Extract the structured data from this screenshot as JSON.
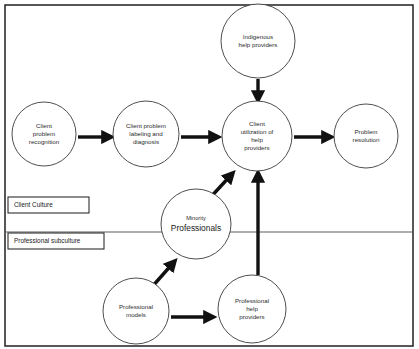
{
  "diagram": {
    "frame": {
      "x": 5,
      "y": 5,
      "width": 408,
      "height": 341
    },
    "divider": {
      "y": 232,
      "x1": 5,
      "x2": 413,
      "label_above": "Client Culture",
      "label_below": "Professional subculture"
    },
    "colors": {
      "node_stroke": "#3a3a3a",
      "arrow": "#111111",
      "frame": "#202020",
      "divider": "#5a5a5a",
      "background": "#ffffff",
      "text": "#2b2b2b"
    },
    "nodes": [
      {
        "id": "indigenous-help-providers",
        "name": "indigenous-help-providers-node",
        "cx": 258,
        "cy": 41,
        "r": 37,
        "lines": [
          "Indigenous",
          "help providers"
        ],
        "style": "normal"
      },
      {
        "id": "client-problem-recognition",
        "name": "client-problem-recognition-node",
        "cx": 44,
        "cy": 134,
        "r": 32,
        "lines": [
          "Client",
          "problem",
          "recognition"
        ],
        "style": "normal"
      },
      {
        "id": "client-problem-labeling",
        "name": "client-problem-labeling-node",
        "cx": 146,
        "cy": 134,
        "r": 33,
        "lines": [
          "Client problem",
          "labeling and",
          "diagnosis"
        ],
        "style": "normal"
      },
      {
        "id": "client-utilization",
        "name": "client-utilization-node",
        "cx": 257,
        "cy": 136,
        "r": 35,
        "lines": [
          "Client",
          "utilization of",
          "help",
          "providers"
        ],
        "style": "normal"
      },
      {
        "id": "problem-resolution",
        "name": "problem-resolution-node",
        "cx": 366,
        "cy": 136,
        "r": 32,
        "lines": [
          "Problem",
          "resolution"
        ],
        "style": "normal"
      },
      {
        "id": "minority-professionals",
        "name": "minority-professionals-node",
        "cx": 196,
        "cy": 224,
        "r": 35,
        "lines": [
          "Minority",
          "Professionals"
        ],
        "style": "emphasis"
      },
      {
        "id": "professional-models",
        "name": "professional-models-node",
        "cx": 136,
        "cy": 311,
        "r": 33,
        "lines": [
          "Professional",
          "models"
        ],
        "style": "normal"
      },
      {
        "id": "professional-help-providers",
        "name": "professional-help-providers-node",
        "cx": 252,
        "cy": 309,
        "r": 34,
        "lines": [
          "Professional",
          "help",
          "providers"
        ],
        "style": "normal"
      }
    ],
    "arrows": [
      {
        "id": "a1",
        "name": "arrow-recognition-to-labeling",
        "from": "client-problem-recognition",
        "to": "client-problem-labeling",
        "x1": 78,
        "y1": 137,
        "x2": 110,
        "y2": 137
      },
      {
        "id": "a2",
        "name": "arrow-labeling-to-utilization",
        "from": "client-problem-labeling",
        "to": "client-utilization",
        "x1": 181,
        "y1": 137,
        "x2": 217,
        "y2": 137
      },
      {
        "id": "a3",
        "name": "arrow-utilization-to-resolution",
        "from": "client-utilization",
        "to": "problem-resolution",
        "x1": 294,
        "y1": 137,
        "x2": 330,
        "y2": 137
      },
      {
        "id": "a4",
        "name": "arrow-indigenous-to-utilization",
        "from": "indigenous-help-providers",
        "to": "client-utilization",
        "x1": 258,
        "y1": 79,
        "x2": 258,
        "y2": 99
      },
      {
        "id": "a5",
        "name": "arrow-minority-to-utilization",
        "from": "minority-professionals",
        "to": "client-utilization",
        "x1": 208,
        "y1": 200,
        "x2": 232,
        "y2": 174
      },
      {
        "id": "a6",
        "name": "arrow-professional-help-to-utilization",
        "from": "professional-help-providers",
        "to": "client-utilization",
        "x1": 258,
        "y1": 275,
        "x2": 258,
        "y2": 174
      },
      {
        "id": "a7",
        "name": "arrow-models-to-minority",
        "from": "professional-models",
        "to": "minority-professionals",
        "x1": 151,
        "y1": 288,
        "x2": 174,
        "y2": 262
      },
      {
        "id": "a8",
        "name": "arrow-models-to-professional-help",
        "from": "professional-models",
        "to": "professional-help-providers",
        "x1": 171,
        "y1": 317,
        "x2": 212,
        "y2": 317
      }
    ],
    "tags": [
      {
        "id": "client-culture",
        "name": "client-culture-tag",
        "label": "Client Culture",
        "x": 8,
        "y": 197,
        "width": 81,
        "height": 16
      },
      {
        "id": "professional-subculture",
        "name": "professional-subculture-tag",
        "label": "Professional subculture",
        "x": 8,
        "y": 233,
        "width": 96,
        "height": 16
      }
    ]
  }
}
